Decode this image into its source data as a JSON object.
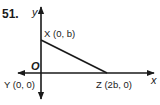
{
  "problem": {
    "number": "51."
  },
  "axes": {
    "x_label": "x",
    "y_label": "y",
    "origin_label": "O"
  },
  "points": [
    {
      "name": "X",
      "label": "X (0, b)",
      "coords": [
        0,
        "b"
      ]
    },
    {
      "name": "Y",
      "label": "Y (0, 0)",
      "coords": [
        0,
        0
      ]
    },
    {
      "name": "Z",
      "label": "Z (2b, 0)",
      "coords": [
        "2b",
        0
      ]
    }
  ],
  "colors": {
    "line": "#1a1a1a",
    "background": "#ffffff"
  }
}
